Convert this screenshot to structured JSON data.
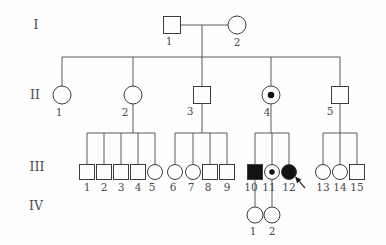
{
  "figure": {
    "kind": "pedigree-chart",
    "canvas": {
      "width": 386,
      "height": 245,
      "background": "#fefefe"
    },
    "style": {
      "line_color": "#5a5a5a",
      "shape_stroke": "#3c3c3c",
      "solid_fill": "#121212",
      "open_fill": "#fefefe",
      "text_color": "#4a4a4a",
      "line_width": 1
    },
    "generation_labels": [
      {
        "text": "I",
        "x": 36,
        "y": 29
      },
      {
        "text": "II",
        "x": 35,
        "y": 99
      },
      {
        "text": "III",
        "x": 37,
        "y": 171
      },
      {
        "text": "IV",
        "x": 36,
        "y": 210
      }
    ],
    "individuals": [
      {
        "id": "I-1",
        "label": "1",
        "shape": "square",
        "x": 172,
        "y": 25,
        "size": 8.5,
        "fill": "open",
        "label_dx": -3
      },
      {
        "id": "I-2",
        "label": "2",
        "shape": "circle",
        "x": 237,
        "y": 25,
        "size": 9,
        "fill": "open",
        "label_dx": 0
      },
      {
        "id": "II-1",
        "label": "1",
        "shape": "circle",
        "x": 62,
        "y": 95,
        "size": 9,
        "fill": "open",
        "label_dx": -3
      },
      {
        "id": "II-2",
        "label": "2",
        "shape": "circle",
        "x": 133,
        "y": 95,
        "size": 9,
        "fill": "open",
        "label_dx": -8
      },
      {
        "id": "II-3",
        "label": "3",
        "shape": "square",
        "x": 202,
        "y": 95,
        "size": 8.5,
        "fill": "open",
        "label_dx": -12
      },
      {
        "id": "II-4",
        "label": "4",
        "shape": "circle",
        "x": 271,
        "y": 95,
        "size": 9,
        "fill": "dot",
        "label_dx": -4
      },
      {
        "id": "II-5",
        "label": "5",
        "shape": "square",
        "x": 340,
        "y": 95,
        "size": 8.5,
        "fill": "open",
        "label_dx": -10
      },
      {
        "id": "III-1",
        "label": "1",
        "shape": "square",
        "x": 87,
        "y": 172,
        "size": 7.5,
        "fill": "open",
        "label_dx": 0
      },
      {
        "id": "III-2",
        "label": "2",
        "shape": "square",
        "x": 104,
        "y": 172,
        "size": 7.5,
        "fill": "open",
        "label_dx": 0
      },
      {
        "id": "III-3",
        "label": "3",
        "shape": "square",
        "x": 121,
        "y": 172,
        "size": 7.5,
        "fill": "open",
        "label_dx": 0
      },
      {
        "id": "III-4",
        "label": "4",
        "shape": "square",
        "x": 138,
        "y": 172,
        "size": 7.5,
        "fill": "open",
        "label_dx": 0
      },
      {
        "id": "III-5",
        "label": "5",
        "shape": "circle",
        "x": 155,
        "y": 172,
        "size": 7.5,
        "fill": "open",
        "label_dx": -3
      },
      {
        "id": "III-6",
        "label": "6",
        "shape": "circle",
        "x": 175,
        "y": 172,
        "size": 7.5,
        "fill": "open",
        "label_dx": -2
      },
      {
        "id": "III-7",
        "label": "7",
        "shape": "circle",
        "x": 193,
        "y": 172,
        "size": 7.5,
        "fill": "open",
        "label_dx": -2
      },
      {
        "id": "III-8",
        "label": "8",
        "shape": "square",
        "x": 210,
        "y": 172,
        "size": 7.5,
        "fill": "open",
        "label_dx": -2
      },
      {
        "id": "III-9",
        "label": "9",
        "shape": "square",
        "x": 227,
        "y": 172,
        "size": 7.5,
        "fill": "open",
        "label_dx": 0
      },
      {
        "id": "III-10",
        "label": "10",
        "shape": "square",
        "x": 255,
        "y": 172,
        "size": 7.5,
        "fill": "solid",
        "label_dx": -4
      },
      {
        "id": "III-11",
        "label": "11",
        "shape": "circle",
        "x": 272,
        "y": 172,
        "size": 7.5,
        "fill": "dot",
        "label_dx": -3
      },
      {
        "id": "III-12",
        "label": "12",
        "shape": "circle",
        "x": 289,
        "y": 172,
        "size": 7.5,
        "fill": "solid",
        "label_dx": 0
      },
      {
        "id": "III-13",
        "label": "13",
        "shape": "circle",
        "x": 323,
        "y": 172,
        "size": 7.5,
        "fill": "open",
        "label_dx": 0
      },
      {
        "id": "III-14",
        "label": "14",
        "shape": "circle",
        "x": 340,
        "y": 172,
        "size": 7.5,
        "fill": "open",
        "label_dx": 0
      },
      {
        "id": "III-15",
        "label": "15",
        "shape": "square",
        "x": 357,
        "y": 172,
        "size": 7.5,
        "fill": "open",
        "label_dx": 0
      },
      {
        "id": "IV-1",
        "label": "1",
        "shape": "circle",
        "x": 255,
        "y": 215,
        "size": 8,
        "fill": "open",
        "label_dx": -2
      },
      {
        "id": "IV-2",
        "label": "2",
        "shape": "circle",
        "x": 272,
        "y": 215,
        "size": 8,
        "fill": "open",
        "label_dx": 0
      }
    ],
    "connectors": [
      [
        180.5,
        25,
        228,
        25
      ],
      [
        202,
        25,
        202,
        57
      ],
      [
        62,
        57,
        340,
        57
      ],
      [
        62,
        57,
        62,
        86
      ],
      [
        133,
        57,
        133,
        86
      ],
      [
        202,
        57,
        202,
        86.5
      ],
      [
        271,
        57,
        271,
        86
      ],
      [
        340,
        57,
        340,
        86.5
      ],
      [
        133,
        104,
        133,
        133
      ],
      [
        202,
        103.5,
        202,
        133
      ],
      [
        271,
        104,
        271,
        133
      ],
      [
        340,
        103.5,
        340,
        133
      ],
      [
        87,
        133,
        155,
        133
      ],
      [
        175,
        133,
        227,
        133
      ],
      [
        255,
        133,
        289,
        133
      ],
      [
        323,
        133,
        357,
        133
      ],
      [
        87,
        133,
        87,
        164.5
      ],
      [
        104,
        133,
        104,
        164.5
      ],
      [
        121,
        133,
        121,
        164.5
      ],
      [
        138,
        133,
        138,
        164.5
      ],
      [
        155,
        133,
        155,
        164.5
      ],
      [
        175,
        133,
        175,
        164.5
      ],
      [
        193,
        133,
        193,
        164.5
      ],
      [
        210,
        133,
        210,
        164.5
      ],
      [
        227,
        133,
        227,
        164.5
      ],
      [
        255,
        133,
        255,
        164.5
      ],
      [
        272,
        133,
        272,
        164.5
      ],
      [
        289,
        133,
        289,
        164.5
      ],
      [
        323,
        133,
        323,
        164.5
      ],
      [
        340,
        133,
        340,
        164.5
      ],
      [
        357,
        133,
        357,
        164.5
      ],
      [
        255,
        179.5,
        255,
        207
      ],
      [
        272,
        179.5,
        272,
        207
      ]
    ],
    "proband_arrow": {
      "points_to": "III-12",
      "tip_x": 295,
      "tip_y": 176.5,
      "tail_x": 305,
      "tail_y": 188
    },
    "legend_semantics": {
      "square": "male",
      "circle": "female",
      "solid": "affected",
      "dot": "carrier",
      "arrow": "proband"
    }
  }
}
